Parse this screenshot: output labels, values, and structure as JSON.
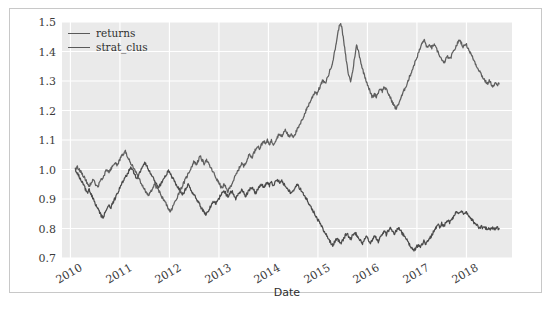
{
  "chart_data": {
    "type": "line",
    "title": "",
    "xlabel": "Date",
    "ylabel": "",
    "ylim": [
      0.7,
      1.5
    ],
    "yticks": [
      "1.5",
      "1.4",
      "1.3",
      "1.2",
      "1.1",
      "1.0",
      "0.9",
      "0.8",
      "0.7"
    ],
    "ytick_values": [
      1.5,
      1.4,
      1.3,
      1.2,
      1.1,
      1.0,
      0.9,
      0.8,
      0.7
    ],
    "xticks": [
      "2010",
      "2011",
      "2012",
      "2013",
      "2014",
      "2015",
      "2016",
      "2017",
      "2018"
    ],
    "xtick_values": [
      2010,
      2011,
      2012,
      2013,
      2014,
      2015,
      2016,
      2017,
      2018
    ],
    "xlim": [
      2009.83,
      2018.92
    ],
    "grid": true,
    "grid_color": "#ffffff",
    "plot_background": "#eaeaea",
    "figure_background": "#ffffff",
    "legend_position": "upper left",
    "legend": [
      "returns",
      "strat_clus"
    ],
    "series": [
      {
        "name": "returns",
        "color": "#4a4a4a",
        "x": [
          2010.1,
          2010.14,
          2010.18,
          2010.22,
          2010.26,
          2010.3,
          2010.34,
          2010.38,
          2010.42,
          2010.46,
          2010.5,
          2010.54,
          2010.58,
          2010.62,
          2010.66,
          2010.7,
          2010.74,
          2010.78,
          2010.82,
          2010.86,
          2010.9,
          2010.94,
          2010.98,
          2011.02,
          2011.06,
          2011.1,
          2011.14,
          2011.18,
          2011.22,
          2011.26,
          2011.3,
          2011.34,
          2011.38,
          2011.42,
          2011.46,
          2011.5,
          2011.54,
          2011.58,
          2011.62,
          2011.66,
          2011.7,
          2011.74,
          2011.78,
          2011.82,
          2011.86,
          2011.9,
          2011.94,
          2011.98,
          2012.02,
          2012.06,
          2012.1,
          2012.14,
          2012.18,
          2012.22,
          2012.26,
          2012.3,
          2012.34,
          2012.38,
          2012.42,
          2012.46,
          2012.5,
          2012.54,
          2012.58,
          2012.62,
          2012.66,
          2012.7,
          2012.74,
          2012.78,
          2012.82,
          2012.86,
          2012.9,
          2012.94,
          2012.98,
          2013.02,
          2013.06,
          2013.1,
          2013.14,
          2013.18,
          2013.22,
          2013.26,
          2013.3,
          2013.34,
          2013.38,
          2013.42,
          2013.46,
          2013.5,
          2013.54,
          2013.58,
          2013.62,
          2013.66,
          2013.7,
          2013.74,
          2013.78,
          2013.82,
          2013.86,
          2013.9,
          2013.94,
          2013.98,
          2014.02,
          2014.06,
          2014.1,
          2014.14,
          2014.18,
          2014.22,
          2014.26,
          2014.3,
          2014.34,
          2014.38,
          2014.42,
          2014.46,
          2014.5,
          2014.54,
          2014.58,
          2014.62,
          2014.66,
          2014.7,
          2014.74,
          2014.78,
          2014.82,
          2014.86,
          2014.9,
          2014.94,
          2014.98,
          2015.02,
          2015.06,
          2015.1,
          2015.14,
          2015.18,
          2015.22,
          2015.26,
          2015.3,
          2015.34,
          2015.38,
          2015.42,
          2015.46,
          2015.5,
          2015.54,
          2015.58,
          2015.62,
          2015.66,
          2015.7,
          2015.74,
          2015.78,
          2015.82,
          2015.86,
          2015.9,
          2015.94,
          2015.98,
          2016.02,
          2016.06,
          2016.1,
          2016.14,
          2016.18,
          2016.22,
          2016.26,
          2016.3,
          2016.34,
          2016.38,
          2016.42,
          2016.46,
          2016.5,
          2016.54,
          2016.58,
          2016.62,
          2016.66,
          2016.7,
          2016.74,
          2016.78,
          2016.82,
          2016.86,
          2016.9,
          2016.94,
          2016.98,
          2017.02,
          2017.06,
          2017.1,
          2017.14,
          2017.18,
          2017.22,
          2017.26,
          2017.3,
          2017.34,
          2017.38,
          2017.42,
          2017.46,
          2017.5,
          2017.54,
          2017.58,
          2017.62,
          2017.66,
          2017.7,
          2017.74,
          2017.78,
          2017.82,
          2017.86,
          2017.9,
          2017.94,
          2017.98,
          2018.02,
          2018.06,
          2018.1,
          2018.14,
          2018.18,
          2018.22,
          2018.26,
          2018.3,
          2018.34,
          2018.38,
          2018.42,
          2018.46,
          2018.5,
          2018.54,
          2018.58,
          2018.62,
          2018.66
        ],
        "y": [
          1.0,
          0.988,
          0.975,
          0.962,
          0.948,
          0.935,
          0.922,
          0.93,
          0.915,
          0.9,
          0.885,
          0.87,
          0.858,
          0.845,
          0.838,
          0.852,
          0.866,
          0.88,
          0.872,
          0.888,
          0.902,
          0.918,
          0.93,
          0.946,
          0.958,
          0.97,
          0.982,
          0.995,
          1.005,
          0.995,
          0.982,
          0.97,
          0.982,
          0.996,
          1.01,
          1.022,
          1.012,
          1.0,
          0.988,
          0.975,
          0.962,
          0.95,
          0.938,
          0.948,
          0.96,
          0.972,
          0.984,
          0.996,
          0.986,
          0.972,
          0.96,
          0.948,
          0.938,
          0.926,
          0.915,
          0.925,
          0.938,
          0.948,
          0.936,
          0.924,
          0.912,
          0.902,
          0.89,
          0.878,
          0.866,
          0.856,
          0.846,
          0.858,
          0.87,
          0.882,
          0.894,
          0.884,
          0.896,
          0.908,
          0.92,
          0.93,
          0.918,
          0.906,
          0.916,
          0.926,
          0.914,
          0.902,
          0.912,
          0.922,
          0.932,
          0.92,
          0.91,
          0.922,
          0.932,
          0.942,
          0.93,
          0.92,
          0.932,
          0.942,
          0.952,
          0.94,
          0.948,
          0.958,
          0.946,
          0.956,
          0.948,
          0.958,
          0.966,
          0.956,
          0.962,
          0.954,
          0.946,
          0.938,
          0.928,
          0.918,
          0.93,
          0.94,
          0.948,
          0.94,
          0.93,
          0.92,
          0.908,
          0.896,
          0.884,
          0.872,
          0.86,
          0.848,
          0.836,
          0.824,
          0.812,
          0.8,
          0.788,
          0.776,
          0.764,
          0.752,
          0.742,
          0.756,
          0.768,
          0.758,
          0.748,
          0.76,
          0.772,
          0.784,
          0.774,
          0.764,
          0.776,
          0.788,
          0.778,
          0.768,
          0.758,
          0.748,
          0.76,
          0.772,
          0.762,
          0.752,
          0.764,
          0.776,
          0.766,
          0.756,
          0.768,
          0.78,
          0.79,
          0.78,
          0.792,
          0.802,
          0.792,
          0.782,
          0.792,
          0.802,
          0.794,
          0.784,
          0.774,
          0.764,
          0.754,
          0.744,
          0.734,
          0.724,
          0.734,
          0.744,
          0.736,
          0.746,
          0.756,
          0.748,
          0.758,
          0.768,
          0.778,
          0.79,
          0.802,
          0.812,
          0.806,
          0.816,
          0.808,
          0.818,
          0.828,
          0.82,
          0.83,
          0.84,
          0.85,
          0.858,
          0.852,
          0.858,
          0.85,
          0.856,
          0.848,
          0.84,
          0.832,
          0.824,
          0.816,
          0.808,
          0.802,
          0.806,
          0.8,
          0.804,
          0.798,
          0.802,
          0.798,
          0.802,
          0.8,
          0.802,
          0.8
        ]
      },
      {
        "name": "strat_clus",
        "color": "#5f5f5f",
        "x": [
          2010.1,
          2010.14,
          2010.18,
          2010.22,
          2010.26,
          2010.3,
          2010.34,
          2010.38,
          2010.42,
          2010.46,
          2010.5,
          2010.54,
          2010.58,
          2010.62,
          2010.66,
          2010.7,
          2010.74,
          2010.78,
          2010.82,
          2010.86,
          2010.9,
          2010.94,
          2010.98,
          2011.02,
          2011.06,
          2011.1,
          2011.14,
          2011.18,
          2011.22,
          2011.26,
          2011.3,
          2011.34,
          2011.38,
          2011.42,
          2011.46,
          2011.5,
          2011.54,
          2011.58,
          2011.62,
          2011.66,
          2011.7,
          2011.74,
          2011.78,
          2011.82,
          2011.86,
          2011.9,
          2011.94,
          2011.98,
          2012.02,
          2012.06,
          2012.1,
          2012.14,
          2012.18,
          2012.22,
          2012.26,
          2012.3,
          2012.34,
          2012.38,
          2012.42,
          2012.46,
          2012.5,
          2012.54,
          2012.58,
          2012.62,
          2012.66,
          2012.7,
          2012.74,
          2012.78,
          2012.82,
          2012.86,
          2012.9,
          2012.94,
          2012.98,
          2013.02,
          2013.06,
          2013.1,
          2013.14,
          2013.18,
          2013.22,
          2013.26,
          2013.3,
          2013.34,
          2013.38,
          2013.42,
          2013.46,
          2013.5,
          2013.54,
          2013.58,
          2013.62,
          2013.66,
          2013.7,
          2013.74,
          2013.78,
          2013.82,
          2013.86,
          2013.9,
          2013.94,
          2013.98,
          2014.02,
          2014.06,
          2014.1,
          2014.14,
          2014.18,
          2014.22,
          2014.26,
          2014.3,
          2014.34,
          2014.38,
          2014.42,
          2014.46,
          2014.5,
          2014.54,
          2014.58,
          2014.62,
          2014.66,
          2014.7,
          2014.74,
          2014.78,
          2014.82,
          2014.86,
          2014.9,
          2014.94,
          2014.98,
          2015.02,
          2015.06,
          2015.1,
          2015.14,
          2015.18,
          2015.22,
          2015.26,
          2015.3,
          2015.34,
          2015.38,
          2015.42,
          2015.46,
          2015.5,
          2015.54,
          2015.58,
          2015.62,
          2015.66,
          2015.7,
          2015.74,
          2015.78,
          2015.82,
          2015.86,
          2015.9,
          2015.94,
          2015.98,
          2016.02,
          2016.06,
          2016.1,
          2016.14,
          2016.18,
          2016.22,
          2016.26,
          2016.3,
          2016.34,
          2016.38,
          2016.42,
          2016.46,
          2016.5,
          2016.54,
          2016.58,
          2016.62,
          2016.66,
          2016.7,
          2016.74,
          2016.78,
          2016.82,
          2016.86,
          2016.9,
          2016.94,
          2016.98,
          2017.02,
          2017.06,
          2017.1,
          2017.14,
          2017.18,
          2017.22,
          2017.26,
          2017.3,
          2017.34,
          2017.38,
          2017.42,
          2017.46,
          2017.5,
          2017.54,
          2017.58,
          2017.62,
          2017.66,
          2017.7,
          2017.74,
          2017.78,
          2017.82,
          2017.86,
          2017.9,
          2017.94,
          2017.98,
          2018.02,
          2018.06,
          2018.1,
          2018.14,
          2018.18,
          2018.22,
          2018.26,
          2018.3,
          2018.34,
          2018.38,
          2018.42,
          2018.46,
          2018.5,
          2018.54,
          2018.58,
          2018.62,
          2018.66
        ],
        "y": [
          1.0,
          1.008,
          1.0,
          0.99,
          0.978,
          0.966,
          0.954,
          0.944,
          0.956,
          0.966,
          0.952,
          0.94,
          0.952,
          0.964,
          0.976,
          0.988,
          1.0,
          0.99,
          1.002,
          1.014,
          1.026,
          1.014,
          1.026,
          1.04,
          1.052,
          1.064,
          1.05,
          1.036,
          1.022,
          1.008,
          0.996,
          0.984,
          0.97,
          0.958,
          0.944,
          0.932,
          0.92,
          0.908,
          0.924,
          0.938,
          0.95,
          0.94,
          0.928,
          0.916,
          0.904,
          0.892,
          0.88,
          0.868,
          0.856,
          0.87,
          0.886,
          0.9,
          0.916,
          0.93,
          0.944,
          0.958,
          0.972,
          0.986,
          1.0,
          1.014,
          1.028,
          1.016,
          1.03,
          1.044,
          1.032,
          1.02,
          1.034,
          1.022,
          1.01,
          0.998,
          0.986,
          0.972,
          0.96,
          0.948,
          0.936,
          0.948,
          0.938,
          0.926,
          0.938,
          0.952,
          0.966,
          0.98,
          0.994,
          1.008,
          1.022,
          1.01,
          1.024,
          1.038,
          1.052,
          1.04,
          1.054,
          1.068,
          1.082,
          1.07,
          1.084,
          1.098,
          1.086,
          1.098,
          1.086,
          1.098,
          1.086,
          1.098,
          1.11,
          1.122,
          1.11,
          1.122,
          1.134,
          1.122,
          1.11,
          1.122,
          1.112,
          1.122,
          1.134,
          1.146,
          1.16,
          1.176,
          1.192,
          1.208,
          1.222,
          1.236,
          1.25,
          1.264,
          1.258,
          1.272,
          1.288,
          1.302,
          1.29,
          1.306,
          1.324,
          1.344,
          1.368,
          1.4,
          1.44,
          1.478,
          1.5,
          1.46,
          1.41,
          1.36,
          1.32,
          1.3,
          1.33,
          1.38,
          1.42,
          1.4,
          1.37,
          1.34,
          1.32,
          1.3,
          1.28,
          1.26,
          1.244,
          1.256,
          1.248,
          1.262,
          1.276,
          1.266,
          1.28,
          1.27,
          1.258,
          1.244,
          1.23,
          1.216,
          1.206,
          1.22,
          1.236,
          1.252,
          1.268,
          1.284,
          1.3,
          1.318,
          1.336,
          1.354,
          1.372,
          1.39,
          1.408,
          1.426,
          1.44,
          1.424,
          1.41,
          1.424,
          1.412,
          1.424,
          1.412,
          1.4,
          1.386,
          1.372,
          1.36,
          1.372,
          1.384,
          1.372,
          1.386,
          1.4,
          1.414,
          1.428,
          1.44,
          1.428,
          1.414,
          1.428,
          1.416,
          1.402,
          1.388,
          1.374,
          1.36,
          1.346,
          1.336,
          1.322,
          1.31,
          1.3,
          1.29,
          1.3,
          1.29,
          1.282,
          1.292,
          1.286,
          1.29
        ]
      }
    ]
  }
}
